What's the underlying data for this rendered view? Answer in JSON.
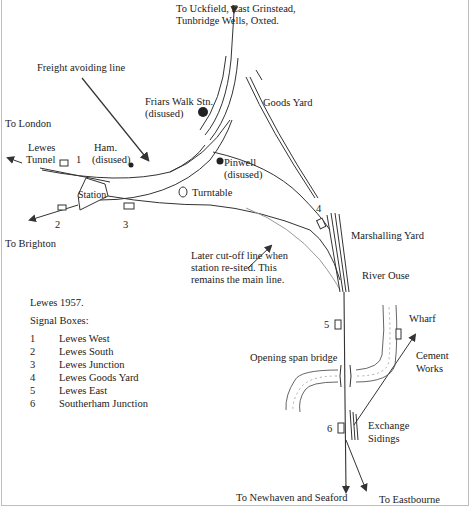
{
  "map": {
    "title": "Lewes 1957.",
    "labels": {
      "to_uckfield": "To Uckfield, East Grinstead,",
      "to_uckfield_2": "Tunbridge Wells, Oxted.",
      "freight_avoiding": "Freight avoiding line",
      "friars_walk": "Friars Walk Stn.",
      "friars_walk_status": "(disused)",
      "goods_yard": "Goods Yard",
      "to_london": "To London",
      "lewes_tunnel_1": "Lewes",
      "lewes_tunnel_2": "Tunnel",
      "ham": "Ham.",
      "ham_status": "(disused)",
      "pinwell": "Pinwell",
      "pinwell_status": "(disused)",
      "station": "Station",
      "turntable": "Turntable",
      "to_brighton": "To Brighton",
      "marshalling_yard": "Marshalling Yard",
      "later_cutoff_1": "Later cut-off line when",
      "later_cutoff_2": "station re-sited. This",
      "later_cutoff_3": "remains the main line.",
      "river_ouse": "River Ouse",
      "wharf": "Wharf",
      "cement_1": "Cement",
      "cement_2": "Works",
      "opening_bridge": "Opening span bridge",
      "exchange_1": "Exchange",
      "exchange_2": "Sidings",
      "to_newhaven": "To Newhaven and Seaford",
      "to_eastbourne": "To Eastbourne"
    },
    "box_numbers": [
      "1",
      "2",
      "3",
      "4",
      "5",
      "6"
    ]
  },
  "key": {
    "title": "Lewes 1957.",
    "subtitle": "Signal Boxes:",
    "items": [
      {
        "num": "1",
        "name": "Lewes West"
      },
      {
        "num": "2",
        "name": "Lewes South"
      },
      {
        "num": "3",
        "name": "Lewes Junction"
      },
      {
        "num": "4",
        "name": "Lewes Goods Yard"
      },
      {
        "num": "5",
        "name": "Lewes East"
      },
      {
        "num": "6",
        "name": "Southerham Junction"
      }
    ]
  }
}
